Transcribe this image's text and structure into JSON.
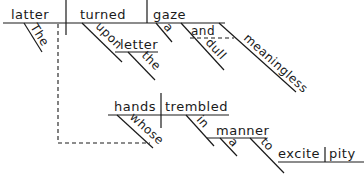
{
  "diagram": {
    "type": "sentence-diagram",
    "main_clause": {
      "subject": "latter",
      "subject_modifier": "The",
      "verb": "turned",
      "verb_prep": "upon",
      "prep_object": "letter",
      "prep_object_modifier": "the",
      "direct_object": "gaze",
      "object_modifiers": [
        "a",
        "dull",
        "meaningless"
      ],
      "conjunction": "and"
    },
    "relative_clause": {
      "subject": "hands",
      "subject_modifier": "whose",
      "verb": "trembled",
      "verb_prep": "in",
      "prep_object": "manner",
      "prep_object_modifier": "a",
      "infinitive_marker": "to",
      "infinitive_verb": "excite",
      "infinitive_object": "pity"
    }
  }
}
